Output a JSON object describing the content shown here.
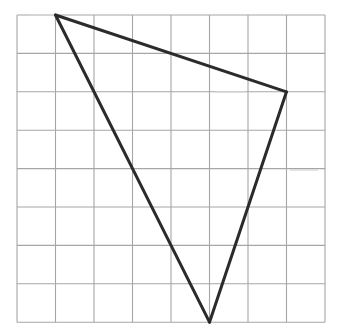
{
  "diagram": {
    "type": "triangle-on-grid",
    "grid": {
      "columns": 8,
      "rows": 8,
      "origin_px": [
        17,
        15
      ],
      "cell_px": [
        38.5,
        38.4
      ],
      "line_color": "#a6a6a6"
    },
    "triangle": {
      "stroke_color": "#2b2b2b",
      "vertices_grid": [
        {
          "name": "A",
          "col": 1,
          "row": 0
        },
        {
          "name": "B",
          "col": 7,
          "row": 2
        },
        {
          "name": "C",
          "col": 5,
          "row": 8
        }
      ],
      "edges": [
        {
          "from": "A",
          "to": "B"
        },
        {
          "from": "B",
          "to": "C"
        },
        {
          "from": "C",
          "to": "A"
        }
      ]
    }
  }
}
